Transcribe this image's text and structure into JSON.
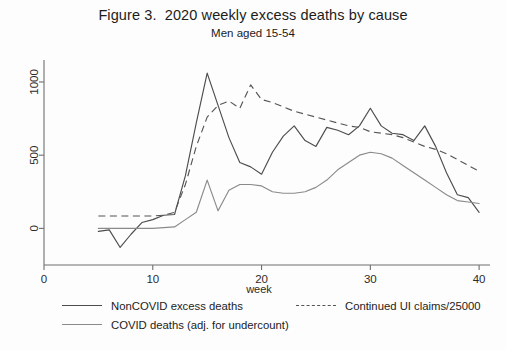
{
  "chart_data": {
    "type": "line",
    "title": "Figure 3.  2020 weekly excess deaths by cause",
    "subtitle": "Men aged 15-54",
    "xlabel": "week",
    "ylabel": "",
    "xlim": [
      0,
      41
    ],
    "ylim": [
      -250,
      1150
    ],
    "xticks": [
      0,
      10,
      20,
      30,
      40
    ],
    "yticks": [
      0,
      500,
      1000
    ],
    "xticklabels": [
      "0",
      "10",
      "20",
      "30",
      "40"
    ],
    "yticklabels": [
      "0",
      "500",
      "1000"
    ],
    "grid": false,
    "legend_position": "below-plot",
    "series": [
      {
        "name": "NonCOVID excess deaths",
        "style": "solid",
        "color": "#4d4d4d",
        "x": [
          5,
          6,
          7,
          8,
          9,
          10,
          11,
          12,
          13,
          14,
          15,
          16,
          17,
          18,
          19,
          20,
          21,
          22,
          23,
          24,
          25,
          26,
          27,
          28,
          29,
          30,
          31,
          32,
          33,
          34,
          35,
          36,
          37,
          38,
          39,
          40
        ],
        "values": [
          -20,
          -10,
          -130,
          -40,
          40,
          60,
          90,
          95,
          360,
          720,
          1060,
          840,
          620,
          450,
          420,
          370,
          520,
          630,
          700,
          600,
          560,
          690,
          670,
          640,
          700,
          820,
          700,
          650,
          640,
          600,
          700,
          560,
          380,
          230,
          210,
          110
        ]
      },
      {
        "name": "COVID deaths (adj. for undercount)",
        "style": "solid",
        "color": "#8a8a8a",
        "x": [
          5,
          6,
          7,
          8,
          9,
          10,
          11,
          12,
          13,
          14,
          15,
          16,
          17,
          18,
          19,
          20,
          21,
          22,
          23,
          24,
          25,
          26,
          27,
          28,
          29,
          30,
          31,
          32,
          33,
          34,
          35,
          36,
          37,
          38,
          39,
          40
        ],
        "values": [
          0,
          0,
          0,
          0,
          0,
          0,
          5,
          10,
          60,
          110,
          330,
          120,
          260,
          300,
          300,
          290,
          250,
          240,
          240,
          250,
          280,
          330,
          400,
          450,
          500,
          520,
          510,
          480,
          430,
          380,
          330,
          280,
          230,
          190,
          180,
          170
        ]
      },
      {
        "name": "Continued UI claims/25000",
        "style": "dashed",
        "color": "#555555",
        "x": [
          5,
          6,
          7,
          8,
          9,
          10,
          11,
          12,
          13,
          14,
          15,
          16,
          17,
          18,
          19,
          20,
          21,
          22,
          23,
          24,
          25,
          26,
          27,
          28,
          29,
          30,
          31,
          32,
          33,
          34,
          35,
          36,
          37,
          38,
          39,
          40
        ],
        "values": [
          85,
          85,
          85,
          85,
          85,
          85,
          90,
          110,
          300,
          560,
          760,
          840,
          870,
          820,
          980,
          880,
          860,
          830,
          800,
          780,
          760,
          740,
          720,
          700,
          690,
          660,
          650,
          640,
          620,
          590,
          560,
          540,
          510,
          470,
          430,
          390
        ]
      }
    ]
  },
  "legend": {
    "entries": [
      {
        "label": "NonCOVID excess deaths"
      },
      {
        "label": "Continued UI claims/25000"
      },
      {
        "label": "COVID deaths (adj. for undercount)"
      }
    ]
  }
}
